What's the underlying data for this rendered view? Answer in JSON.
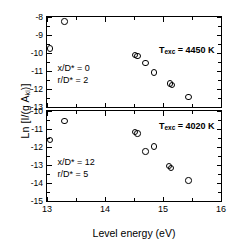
{
  "chart_data": {
    "type": "scatter",
    "title": "",
    "xlabel": "Level energy (eV)",
    "ylabel": "Ln [I/(g A",
    "ylabel_sub": "ki",
    "ylabel_tail": ")]",
    "xlim": [
      13,
      16
    ],
    "xticks": [
      13,
      14,
      15,
      16
    ],
    "xticklabels": [
      "13",
      "14",
      "15",
      "16"
    ],
    "grid": false,
    "legend": "none",
    "panels": [
      {
        "id": "top",
        "ylim": [
          -13,
          -8
        ],
        "yticks": [
          -8,
          -9,
          -10,
          -11,
          -12,
          -13
        ],
        "yticklabels": [
          "-8",
          "-9",
          "-10",
          "-11",
          "-12",
          "-13"
        ],
        "annotation_temp": "T",
        "annotation_temp_sub": "exc",
        "annotation_temp_value": " = 4450 K",
        "annotation_x": "x/D* = 0",
        "annotation_r": "r/D* = 2",
        "x": [
          13.05,
          13.3,
          14.52,
          14.56,
          14.7,
          14.84,
          15.12,
          15.16,
          15.44
        ],
        "y": [
          -9.75,
          -8.25,
          -10.1,
          -10.18,
          -10.55,
          -11.08,
          -11.7,
          -11.78,
          -12.45
        ]
      },
      {
        "id": "bottom",
        "ylim": [
          -15,
          -10
        ],
        "yticks": [
          -10,
          -11,
          -12,
          -13,
          -14,
          -15
        ],
        "yticklabels": [
          "-10",
          "-11",
          "-12",
          "-13",
          "-14",
          "-15"
        ],
        "annotation_temp": "T",
        "annotation_temp_sub": "exc",
        "annotation_temp_value": " = 4020 K",
        "annotation_x": "x/D* = 12",
        "annotation_r": "r/D* = 5",
        "x": [
          13.05,
          13.3,
          14.52,
          14.56,
          14.7,
          14.84,
          15.1,
          15.14,
          15.44
        ],
        "y": [
          -11.6,
          -10.55,
          -11.18,
          -11.26,
          -12.25,
          -11.98,
          -13.05,
          -13.18,
          -13.85
        ]
      }
    ]
  }
}
